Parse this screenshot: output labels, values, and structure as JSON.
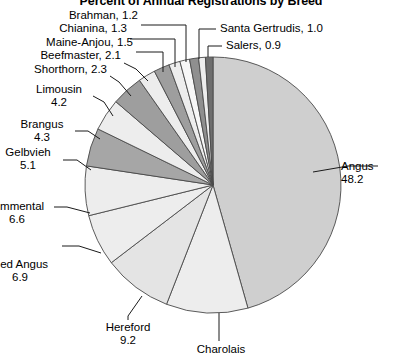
{
  "chart_data": {
    "type": "pie",
    "title": "Percent of Annual Registrations by Breed",
    "subtitle": "",
    "xlabel": "",
    "ylabel": "",
    "units": "percent",
    "legend_position": "none",
    "grid": false,
    "label_format": "name, value / name + value",
    "categories": [
      "Angus",
      "Charolais",
      "Hereford",
      "Red Angus",
      "Simmental",
      "Gelbvieh",
      "Brangus",
      "Limousin",
      "Shorthorn",
      "Beefmaster",
      "Maine-Anjou",
      "Chianina",
      "Brahman",
      "Salers",
      "Santa Gertrudis"
    ],
    "values": [
      48.2,
      10.9,
      9.2,
      6.9,
      6.6,
      5.1,
      4.3,
      4.2,
      2.3,
      2.1,
      1.5,
      1.3,
      1.2,
      0.9,
      1.0
    ],
    "slices": [
      {
        "name": "Angus",
        "value": 48.2,
        "label": "Angus",
        "value_label": "48.2",
        "fill": "#cfcfcf",
        "visible_value": true
      },
      {
        "name": "Charolais",
        "value": 10.9,
        "label": "Charolais",
        "value_label": "",
        "fill": "#ededed",
        "visible_value": false
      },
      {
        "name": "Hereford",
        "value": 9.2,
        "label": "Hereford",
        "value_label": "9.2",
        "fill": "#e4e4e4",
        "visible_value": true
      },
      {
        "name": "Red Angus",
        "value": 6.9,
        "label": "Red Angus",
        "value_label": "6.9",
        "fill": "#ededed",
        "visible_value": true
      },
      {
        "name": "Simmental",
        "value": 6.6,
        "label": "Simmental",
        "value_label": "6.6",
        "fill": "#ededed",
        "visible_value": true
      },
      {
        "name": "Gelbvieh",
        "value": 5.1,
        "label": "Gelbvieh",
        "value_label": "5.1",
        "fill": "#a6a6a6",
        "visible_value": true
      },
      {
        "name": "Brangus",
        "value": 4.3,
        "label": "Brangus",
        "value_label": "4.3",
        "fill": "#ededed",
        "visible_value": true
      },
      {
        "name": "Limousin",
        "value": 4.2,
        "label": "Limousin",
        "value_label": "4.2",
        "fill": "#9e9e9e",
        "visible_value": true
      },
      {
        "name": "Shorthorn",
        "value": 2.3,
        "label": "Shorthorn, 2.3",
        "value_label": "2.3",
        "fill": "#ededed",
        "visible_value": true
      },
      {
        "name": "Beefmaster",
        "value": 2.1,
        "label": "Beefmaster, 2.1",
        "value_label": "2.1",
        "fill": "#9e9e9e",
        "visible_value": true
      },
      {
        "name": "Maine-Anjou",
        "value": 1.5,
        "label": "Maine-Anjou, 1.5",
        "value_label": "1.5",
        "fill": "#ededed",
        "visible_value": true
      },
      {
        "name": "Chianina",
        "value": 1.3,
        "label": "Chianina, 1.3",
        "value_label": "1.3",
        "fill": "#f7f7f7",
        "visible_value": true
      },
      {
        "name": "Brahman",
        "value": 1.2,
        "label": "Brahman, 1.2",
        "value_label": "1.2",
        "fill": "#8f8f8f",
        "visible_value": true
      },
      {
        "name": "Salers",
        "value": 0.9,
        "label": "Salers, 0.9",
        "value_label": "0.9",
        "fill": "#ededed",
        "visible_value": true
      },
      {
        "name": "Santa Gertrudis",
        "value": 1.0,
        "label": "Santa Gertrudis, 1.0",
        "value_label": "1.0",
        "fill": "#6e6e6e",
        "visible_value": true
      }
    ]
  },
  "labels": {
    "angus_name": "Angus",
    "angus_value": "48.2",
    "charolais_name": "Charolais",
    "hereford_name": "Hereford",
    "hereford_value": "9.2",
    "red_angus_name": "Red Angus",
    "red_angus_value": "6.9",
    "simmental_name": "Simmental",
    "simmental_value": "6.6",
    "gelbvieh_name": "Gelbvieh",
    "gelbvieh_value": "5.1",
    "brangus_name": "Brangus",
    "brangus_value": "4.3",
    "limousin_name": "Limousin",
    "limousin_value": "4.2",
    "shorthorn": "Shorthorn, 2.3",
    "beefmaster": "Beefmaster, 2.1",
    "maine_anjou": "Maine-Anjou, 1.5",
    "chianina": "Chianina, 1.3",
    "brahman": "Brahman, 1.2",
    "salers": "Salers, 0.9",
    "santa_gertrudis": "Santa Gertrudis, 1.0"
  },
  "style": {
    "slice_light": "#ededed",
    "slice_medium": "#a6a6a6",
    "slice_dark": "#6e6e6e",
    "slice_angus": "#cfcfcf",
    "outline": "#4a4a4a",
    "leader_line": "#1a1a1a",
    "text": "#000000",
    "background": "#ffffff"
  }
}
